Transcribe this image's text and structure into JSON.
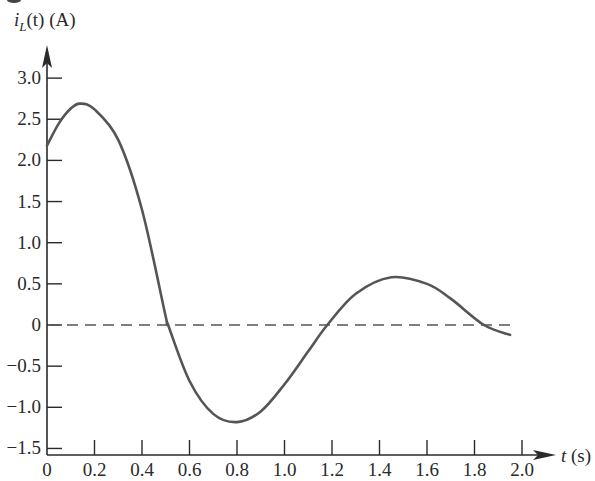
{
  "chart_data": {
    "type": "line",
    "title": "",
    "ylabel": "i_L(t) (A)",
    "ylabel_parts": {
      "var": "i",
      "sub": "L",
      "rest": "(t) (A)"
    },
    "xlabel": "t (s)",
    "xlabel_parts": {
      "var": "t",
      "rest": " (s)"
    },
    "xlim": [
      0,
      2.0
    ],
    "ylim": [
      -1.5,
      3.0
    ],
    "x_ticks": [
      0,
      0.2,
      0.4,
      0.6,
      0.8,
      1.0,
      1.2,
      1.4,
      1.6,
      1.8,
      2.0
    ],
    "x_tick_labels": [
      "0",
      "0.2",
      "0.4",
      "0.6",
      "0.8",
      "1.0",
      "1.2",
      "1.4",
      "1.6",
      "1.8",
      "2.0"
    ],
    "y_ticks": [
      3.0,
      2.5,
      2.0,
      1.5,
      1.0,
      0.5,
      0,
      -0.5,
      -1.0,
      -1.5
    ],
    "y_tick_labels": [
      "3.0",
      "2.5",
      "2.0",
      "1.5",
      "1.0",
      "0.5",
      "0",
      "−0.5",
      "−1.0",
      "−1.5"
    ],
    "grid": false,
    "reference_line": {
      "y": 0,
      "style": "dashed",
      "x_range": [
        0,
        1.95
      ]
    },
    "series": [
      {
        "name": "i_L(t)",
        "color": "#555555",
        "x": [
          0,
          0.05,
          0.1,
          0.14,
          0.2,
          0.3,
          0.4,
          0.5,
          0.51,
          0.6,
          0.7,
          0.8,
          0.9,
          1.0,
          1.1,
          1.18,
          1.3,
          1.45,
          1.6,
          1.7,
          1.84,
          1.95
        ],
        "values": [
          2.18,
          2.45,
          2.63,
          2.69,
          2.62,
          2.25,
          1.4,
          0.1,
          0,
          -0.68,
          -1.08,
          -1.18,
          -1.05,
          -0.72,
          -0.32,
          0,
          0.38,
          0.58,
          0.5,
          0.32,
          0,
          -0.12
        ]
      }
    ],
    "annotations": {
      "peak": {
        "t": 0.14,
        "value": 2.69
      },
      "minimum": {
        "t": 0.8,
        "value": -1.18
      },
      "second_peak": {
        "t": 1.45,
        "value": 0.58
      },
      "zero_crossings": [
        0.51,
        1.18,
        1.84
      ]
    }
  },
  "colors": {
    "axis": "#2a2a2a",
    "curve": "#555555",
    "dashed": "#555555",
    "background": "#ffffff"
  }
}
